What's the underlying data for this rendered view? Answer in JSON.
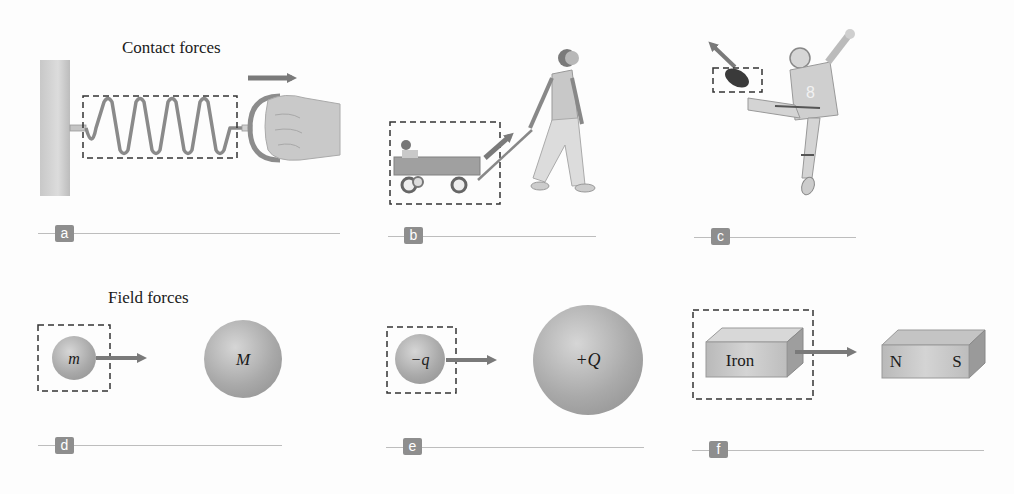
{
  "headings": {
    "contact": "Contact forces",
    "field": "Field forces"
  },
  "panels": [
    {
      "id": "a",
      "label": "a",
      "description": "Hand pulling a spring attached to a wall; spring enclosed in dashed system box; force arrow pointing right"
    },
    {
      "id": "b",
      "label": "b",
      "description": "Girl pulling a wagon with a child; wagon enclosed in dashed system box; force arrow pointing up-right along handle"
    },
    {
      "id": "c",
      "label": "c",
      "description": "Football player kicking a ball; ball enclosed in dashed system box; force arrow pointing up-left"
    },
    {
      "id": "d",
      "label": "d",
      "small_object": "m",
      "large_object": "M",
      "description": "Gravitational attraction between mass m and mass M"
    },
    {
      "id": "e",
      "label": "e",
      "small_object": "−q",
      "large_object": "+Q",
      "description": "Electric attraction between charge -q and charge +Q"
    },
    {
      "id": "f",
      "label": "f",
      "small_object": "Iron",
      "magnet_north": "N",
      "magnet_south": "S",
      "description": "Magnetic attraction between iron block and bar magnet"
    }
  ],
  "colors": {
    "arrow": "#7a7a7a",
    "badge": "#8e8e8e",
    "dashed_box": "#333333",
    "sphere": "#b0b0b0",
    "rule": "#bdbdbd"
  }
}
